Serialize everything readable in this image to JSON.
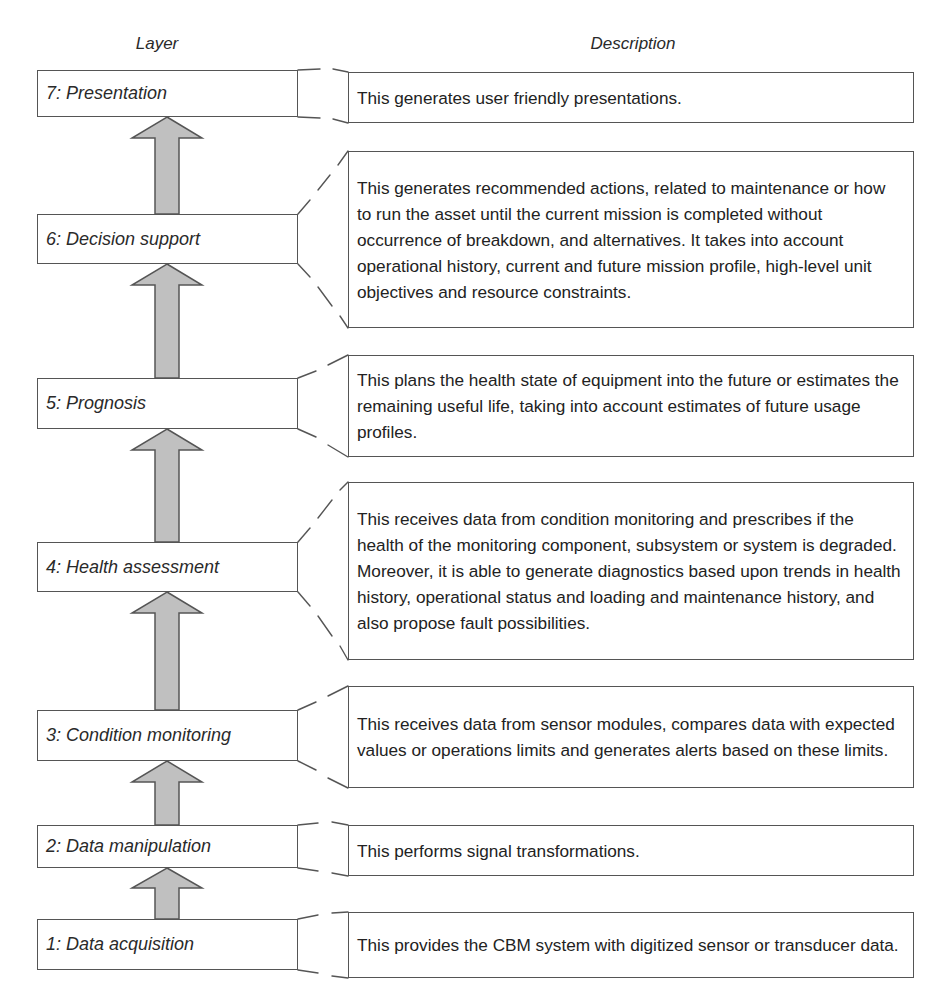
{
  "headers": {
    "layer": "Layer",
    "description": "Description"
  },
  "layers": [
    {
      "label": "7: Presentation",
      "description": "This generates user friendly presentations."
    },
    {
      "label": "6: Decision support",
      "description": "This generates recommended actions, related to maintenance or how to run the asset until the current mission is completed without occurrence of breakdown, and alternatives. It takes into account operational history, current and future mission profile, high-level unit objectives and resource constraints."
    },
    {
      "label": "5: Prognosis",
      "description": "This plans the health state of equipment into the future or estimates the remaining useful life, taking into account estimates of future usage profiles."
    },
    {
      "label": "4: Health assessment",
      "description": "This receives data from condition monitoring and prescribes if the health of the monitoring component, subsystem or system is degraded. Moreover, it is able to generate diagnostics based upon trends in health history, operational status and loading and maintenance history, and also propose fault possibilities."
    },
    {
      "label": "3: Condition monitoring",
      "description": "This receives data from sensor modules, compares data with expected values or operations limits and generates alerts based on these limits."
    },
    {
      "label": "2: Data manipulation",
      "description": "This performs signal transformations."
    },
    {
      "label": "1: Data acquisition",
      "description": "This provides the CBM system with digitized sensor or transducer data."
    }
  ],
  "colors": {
    "arrow_fill": "#c0c0c0",
    "outline": "#555555",
    "text": "#222222"
  }
}
